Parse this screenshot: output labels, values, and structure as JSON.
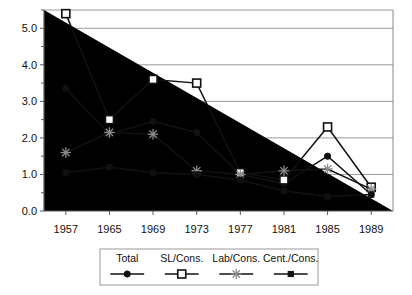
{
  "chart_data": {
    "type": "line",
    "title": "",
    "subtitle": "",
    "xlabel": "",
    "ylabel": "",
    "categories": [
      "1957",
      "1965",
      "1969",
      "1973",
      "1977",
      "1981",
      "1985",
      "1989"
    ],
    "ylim": [
      0.0,
      5.5
    ],
    "ytick_labels": [
      "0.0",
      "1.0",
      "2.0",
      "3.0",
      "4.0",
      "5.0"
    ],
    "ytick_values": [
      0.0,
      1.0,
      2.0,
      3.0,
      4.0,
      5.0
    ],
    "minor_ytick_values": [
      0.5,
      1.5,
      2.5,
      3.5,
      4.5,
      5.5
    ],
    "grid": true,
    "grid_axis": "y",
    "legend_position": "bottom",
    "series": [
      {
        "name": "Total",
        "marker": "filled-circle",
        "values": [
          3.35,
          2.1,
          2.45,
          2.15,
          1.0,
          0.75,
          1.5,
          0.45
        ]
      },
      {
        "name": "SL/Cons.",
        "marker": "open-square",
        "values": [
          5.4,
          2.5,
          3.6,
          3.5,
          1.05,
          0.85,
          2.3,
          0.65
        ]
      },
      {
        "name": "Lab/Cons.",
        "marker": "star",
        "values": [
          1.6,
          2.15,
          2.1,
          1.1,
          1.0,
          1.1,
          1.15,
          0.6
        ]
      },
      {
        "name": "Cent./Cons.",
        "marker": "small-filled-square",
        "values": [
          1.05,
          1.2,
          1.05,
          1.0,
          0.85,
          0.55,
          0.4,
          0.45
        ]
      }
    ]
  },
  "legend": {
    "entries": [
      {
        "label": "Total"
      },
      {
        "label": "SL/Cons."
      },
      {
        "label": "Lab/Cons."
      },
      {
        "label": "Cent./Cons."
      }
    ]
  }
}
